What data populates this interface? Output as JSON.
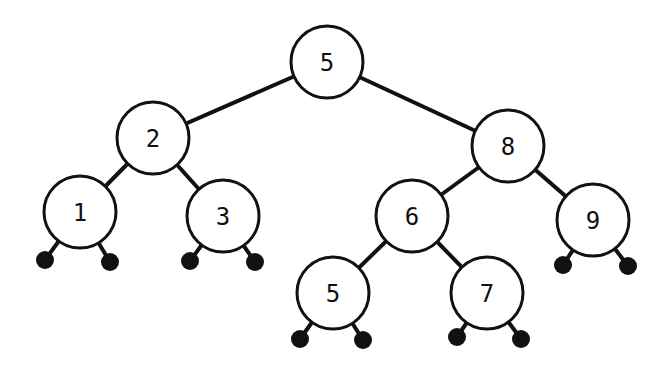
{
  "diagram": {
    "type": "binary-search-tree",
    "node_radius": 36,
    "colors": {
      "stroke": "#111111",
      "fill": "#ffffff",
      "null": "#111111"
    },
    "nodes": [
      {
        "id": "n5root",
        "label": "5",
        "x": 327,
        "y": 62
      },
      {
        "id": "n2",
        "label": "2",
        "x": 153,
        "y": 138
      },
      {
        "id": "n8",
        "label": "8",
        "x": 508,
        "y": 146
      },
      {
        "id": "n1",
        "label": "1",
        "x": 80,
        "y": 212
      },
      {
        "id": "n3",
        "label": "3",
        "x": 223,
        "y": 216
      },
      {
        "id": "n6",
        "label": "6",
        "x": 412,
        "y": 216
      },
      {
        "id": "n9",
        "label": "9",
        "x": 593,
        "y": 220
      },
      {
        "id": "n5leaf",
        "label": "5",
        "x": 333,
        "y": 293
      },
      {
        "id": "n7",
        "label": "7",
        "x": 487,
        "y": 293
      }
    ],
    "edges": [
      {
        "from": "n5root",
        "to": "n2"
      },
      {
        "from": "n5root",
        "to": "n8"
      },
      {
        "from": "n2",
        "to": "n1"
      },
      {
        "from": "n2",
        "to": "n3"
      },
      {
        "from": "n8",
        "to": "n6"
      },
      {
        "from": "n8",
        "to": "n9"
      },
      {
        "from": "n6",
        "to": "n5leaf"
      },
      {
        "from": "n6",
        "to": "n7"
      }
    ],
    "nulls": [
      {
        "parent": "n1",
        "x": 45,
        "y": 260
      },
      {
        "parent": "n1",
        "x": 110,
        "y": 262
      },
      {
        "parent": "n3",
        "x": 190,
        "y": 261
      },
      {
        "parent": "n3",
        "x": 255,
        "y": 262
      },
      {
        "parent": "n9",
        "x": 563,
        "y": 265
      },
      {
        "parent": "n9",
        "x": 628,
        "y": 266
      },
      {
        "parent": "n5leaf",
        "x": 300,
        "y": 339
      },
      {
        "parent": "n5leaf",
        "x": 363,
        "y": 340
      },
      {
        "parent": "n7",
        "x": 457,
        "y": 337
      },
      {
        "parent": "n7",
        "x": 521,
        "y": 339
      }
    ]
  }
}
